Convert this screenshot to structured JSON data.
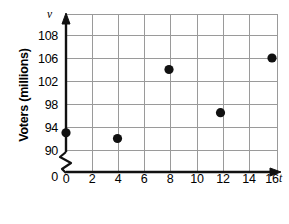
{
  "chart_data": {
    "type": "scatter",
    "title": "",
    "xlabel": "Years since 1984",
    "ylabel": "Voters (millions)",
    "x_axis_variable": "t",
    "y_axis_variable": "v",
    "x_ticks": [
      "0",
      "2",
      "4",
      "6",
      "8",
      "10",
      "12",
      "14",
      "16"
    ],
    "x_tick_values": [
      0,
      2,
      4,
      6,
      8,
      10,
      12,
      14,
      16
    ],
    "y_ticks": [
      "108",
      "106",
      "102",
      "98",
      "94",
      "90",
      "0"
    ],
    "y_tick_values": [
      108,
      106,
      102,
      98,
      94,
      90,
      0
    ],
    "y_axis_break": true,
    "xlim": [
      0,
      17
    ],
    "ylim": [
      90,
      109
    ],
    "grid": true,
    "legend": "none",
    "points": [
      {
        "x": 0,
        "y": 93,
        "label": "(0, 93)"
      },
      {
        "x": 4,
        "y": 92,
        "label": "(4, 92)"
      },
      {
        "x": 8,
        "y": 104,
        "label": "(8, 104)"
      },
      {
        "x": 12,
        "y": 96.5,
        "label": "(12, 96.5)"
      },
      {
        "x": 16,
        "y": 106,
        "label": "(16, 106)"
      }
    ],
    "marker_color": "#111111",
    "grid_color": "#9a9a9a",
    "axis_color": "#111111",
    "background": "#ffffff"
  }
}
